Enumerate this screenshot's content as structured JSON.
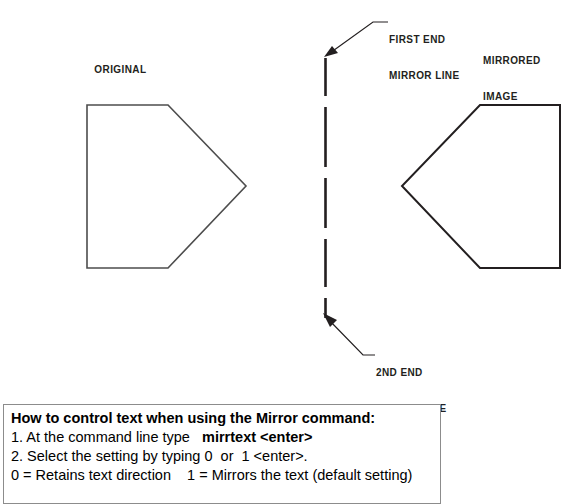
{
  "diagram": {
    "title_labels": {
      "original": "ORIGINAL",
      "mirrored_line1": "MIRRORED",
      "mirrored_line2": "IMAGE",
      "first_end_line1": "FIRST END",
      "first_end_line2": "MIRROR LINE",
      "second_end_line1": "2ND END",
      "second_end_line2": "MIRROR LINE"
    },
    "colors": {
      "shape_stroke": "#4d4d4d",
      "mirror_line": "#231f20",
      "leader": "#231f20",
      "box_border": "#8c8c8c",
      "text": "#000000",
      "background": "#ffffff"
    },
    "shapes": {
      "original_pentagon_points": "87,105 168,105 246,186 168,268 87,268",
      "mirrored_pentagon_points": "560,105 480,105 402,186 480,268 560,268",
      "mirror_line_x": 325,
      "mirror_line_top_y": 58,
      "mirror_line_bottom_y": 320
    }
  },
  "info_box": {
    "heading": "How to control text when using the Mirror command:",
    "line1_prefix": "1. At the command line type   ",
    "line1_bold": "mirrtext <enter>",
    "line2": "2. Select the setting by typing 0  or  1 <enter>.",
    "line3": "0 = Retains text direction    1 = Mirrors the text (default setting)"
  }
}
